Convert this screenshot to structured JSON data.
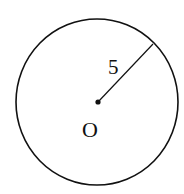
{
  "diagram": {
    "type": "circle-with-radius",
    "center_label": "O",
    "radius_label": "5",
    "colors": {
      "stroke": "#111111",
      "background": "#ffffff"
    }
  }
}
